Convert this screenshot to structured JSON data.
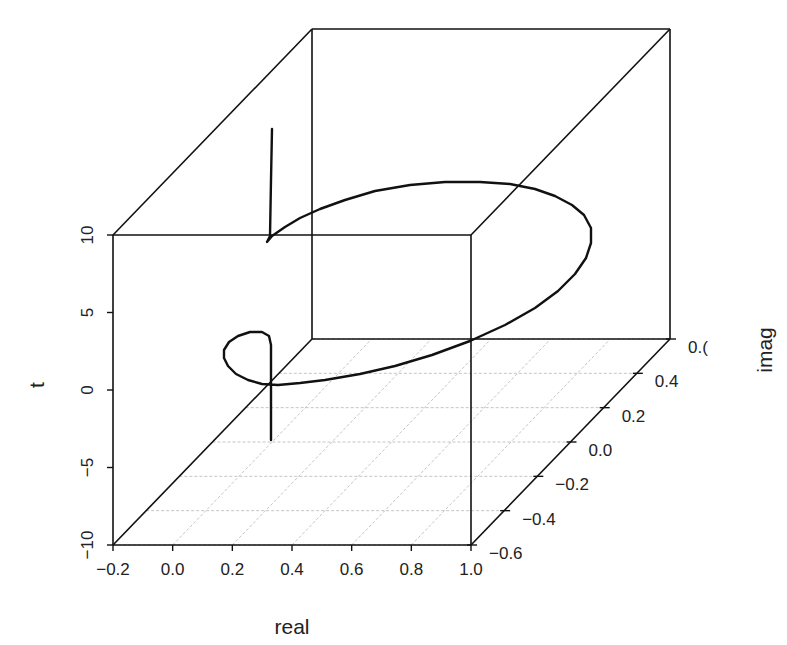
{
  "chart_data": {
    "type": "line",
    "projection": "3d-scatterplot",
    "title": "",
    "axes": {
      "x": {
        "label": "real",
        "range": [
          -0.2,
          1.0
        ],
        "ticks": [
          -0.2,
          0.0,
          0.2,
          0.4,
          0.6,
          0.8,
          1.0
        ],
        "tick_labels": [
          "−0.2",
          "0.0",
          "0.2",
          "0.4",
          "0.6",
          "0.8",
          "1.0"
        ]
      },
      "y": {
        "label": "imag",
        "range": [
          -0.6,
          0.6
        ],
        "ticks": [
          -0.6,
          -0.4,
          -0.2,
          0.0,
          0.2,
          0.4,
          0.6
        ],
        "tick_labels": [
          "−0.6",
          "−0.4",
          "−0.2",
          "0.0",
          "0.2",
          "0.4",
          "0.("
        ]
      },
      "z": {
        "label": "t",
        "range": [
          -10,
          10
        ],
        "ticks": [
          -10,
          -5,
          0,
          5,
          10
        ],
        "tick_labels": [
          "−10",
          "−5",
          "0",
          "5",
          "10"
        ]
      }
    },
    "grid": {
      "floor": true
    },
    "series": [
      {
        "name": "trajectory",
        "style": "line",
        "pixel_path": [
          [
            272,
            129
          ],
          [
            271,
            180
          ],
          [
            270,
            236
          ],
          [
            268,
            240
          ],
          [
            267,
            242
          ],
          [
            272,
            236
          ],
          [
            285,
            227
          ],
          [
            300,
            218
          ],
          [
            320,
            209
          ],
          [
            345,
            200
          ],
          [
            375,
            191
          ],
          [
            410,
            185
          ],
          [
            445,
            182
          ],
          [
            480,
            182
          ],
          [
            510,
            184
          ],
          [
            535,
            189
          ],
          [
            555,
            196
          ],
          [
            572,
            205
          ],
          [
            584,
            215
          ],
          [
            591,
            228
          ],
          [
            591,
            243
          ],
          [
            586,
            258
          ],
          [
            575,
            274
          ],
          [
            558,
            291
          ],
          [
            535,
            308
          ],
          [
            505,
            325
          ],
          [
            470,
            341
          ],
          [
            432,
            355
          ],
          [
            395,
            366
          ],
          [
            360,
            374
          ],
          [
            325,
            380
          ],
          [
            300,
            383
          ],
          [
            278,
            385
          ],
          [
            262,
            384
          ],
          [
            248,
            380
          ],
          [
            236,
            374
          ],
          [
            228,
            366
          ],
          [
            224,
            358
          ],
          [
            224,
            350
          ],
          [
            229,
            342
          ],
          [
            238,
            336
          ],
          [
            250,
            332
          ],
          [
            262,
            332
          ],
          [
            269,
            336
          ],
          [
            271,
            345
          ],
          [
            271,
            360
          ],
          [
            271,
            380
          ],
          [
            271,
            410
          ],
          [
            271,
            440
          ]
        ]
      }
    ]
  },
  "labels": {
    "x_title": "real",
    "y_title": "imag",
    "z_title": "t"
  }
}
